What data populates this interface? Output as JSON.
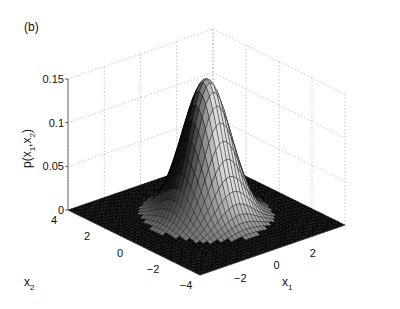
{
  "panel_label": "(b)",
  "chart_data": {
    "type": "surface3d",
    "title": "",
    "function": "bivariate Gaussian density p(x1,x2), mean [0,0], identity covariance",
    "xlabel": "x1",
    "ylabel": "x2",
    "zlabel": "p(x1,x2)",
    "xlim": [
      -4,
      4
    ],
    "ylim": [
      -4,
      4
    ],
    "zlim": [
      0,
      0.15
    ],
    "xticks": [
      -2,
      0,
      2
    ],
    "yticks": [
      4,
      2,
      0,
      -2,
      -4
    ],
    "zticks": [
      0,
      0.05,
      0.1,
      0.15
    ],
    "xtick_labels": [
      "−2",
      "0",
      "2"
    ],
    "ytick_labels": [
      "4",
      "2",
      "0",
      "−2",
      "−4"
    ],
    "ztick_labels": [
      "0",
      "0.05",
      "0.1",
      "0.15"
    ],
    "peak": {
      "x1": 0,
      "x2": 0,
      "p": 0.159
    },
    "grid": true,
    "colormap": "gray",
    "mesh_resolution": 41
  },
  "labels": {
    "x1_main": "x",
    "x1_sub": "1",
    "x2_main": "x",
    "x2_sub": "2",
    "z_text": "p(x",
    "z_sub1": "1",
    "z_mid": ",x",
    "z_sub2": "2",
    "z_close": ")"
  }
}
